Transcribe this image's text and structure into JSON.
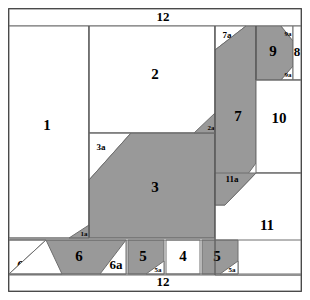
{
  "figure": {
    "canvas": {
      "width": 310,
      "height": 300
    },
    "colors": {
      "gray_fill": "#999999",
      "white_fill": "#ffffff",
      "line": "#6e6e6e",
      "line_dark": "#4a4a4a",
      "text": "#000000",
      "background": "#ffffff"
    },
    "labels": {
      "top_strip": "12",
      "bottom_strip": "12",
      "p1": "1",
      "p1a": "1a",
      "p2": "2",
      "p2a": "2a",
      "p3": "3",
      "p3a": "3a",
      "p4": "4",
      "p5_left": "5",
      "p5_right": "5",
      "p5a_left": "5a",
      "p5a_right": "5a",
      "p6": "6",
      "p6a": "6a",
      "p6b": "6b",
      "p7": "7",
      "p7a": "7a",
      "p8": "8",
      "p9": "9",
      "p9a_top": "9a",
      "p9a_bottom": "9a",
      "p10": "10",
      "p11": "11",
      "p11a": "11a"
    },
    "pieces": [
      {
        "id": "1",
        "label": "1",
        "fill": "white",
        "note": "large left rectangle"
      },
      {
        "id": "1a",
        "label": "1a",
        "fill": "gray",
        "note": "small triangle below piece 1"
      },
      {
        "id": "2",
        "label": "2",
        "fill": "white",
        "note": "upper middle rectangle"
      },
      {
        "id": "2a",
        "label": "2a",
        "fill": "gray",
        "note": "small triangle right of piece 2"
      },
      {
        "id": "3",
        "label": "3",
        "fill": "gray",
        "note": "central large trapezoid"
      },
      {
        "id": "3a",
        "label": "3a",
        "fill": "white",
        "note": "triangle left of piece 3"
      },
      {
        "id": "4",
        "label": "4",
        "fill": "white",
        "note": "bottom row small square"
      },
      {
        "id": "5L",
        "label": "5",
        "fill": "gray",
        "note": "bottom row left block"
      },
      {
        "id": "5aL",
        "label": "5a",
        "fill": "white",
        "note": "triangle cut from left 5"
      },
      {
        "id": "5R",
        "label": "5",
        "fill": "gray",
        "note": "bottom row right block"
      },
      {
        "id": "5aR",
        "label": "5a",
        "fill": "white",
        "note": "triangle cut from right 5"
      },
      {
        "id": "6",
        "label": "6",
        "fill": "gray",
        "note": "bottom left parallelogram"
      },
      {
        "id": "6a",
        "label": "6a",
        "fill": "white",
        "note": "triangle right of piece 6"
      },
      {
        "id": "6b",
        "label": "6b",
        "fill": "white",
        "note": "triangle left of piece 6"
      },
      {
        "id": "7",
        "label": "7",
        "fill": "gray",
        "note": "tall right parallelogram"
      },
      {
        "id": "7a",
        "label": "7a",
        "fill": "white",
        "note": "triangle top-left of piece 7"
      },
      {
        "id": "8",
        "label": "8",
        "fill": "white",
        "note": "narrow right strip"
      },
      {
        "id": "9",
        "label": "9",
        "fill": "gray",
        "note": "upper right hexagon"
      },
      {
        "id": "9a",
        "label": "9a",
        "fill": "white",
        "note": "two corner triangles of piece 9"
      },
      {
        "id": "10",
        "label": "10",
        "fill": "white",
        "note": "right middle rectangle"
      },
      {
        "id": "11",
        "label": "11",
        "fill": "white",
        "note": "right lower rectangle"
      },
      {
        "id": "11a",
        "label": "11a",
        "fill": "gray",
        "note": "triangle notch into piece 11"
      },
      {
        "id": "12T",
        "label": "12",
        "fill": "white",
        "note": "top horizontal strip"
      },
      {
        "id": "12B",
        "label": "12",
        "fill": "white",
        "note": "bottom horizontal strip"
      }
    ]
  }
}
